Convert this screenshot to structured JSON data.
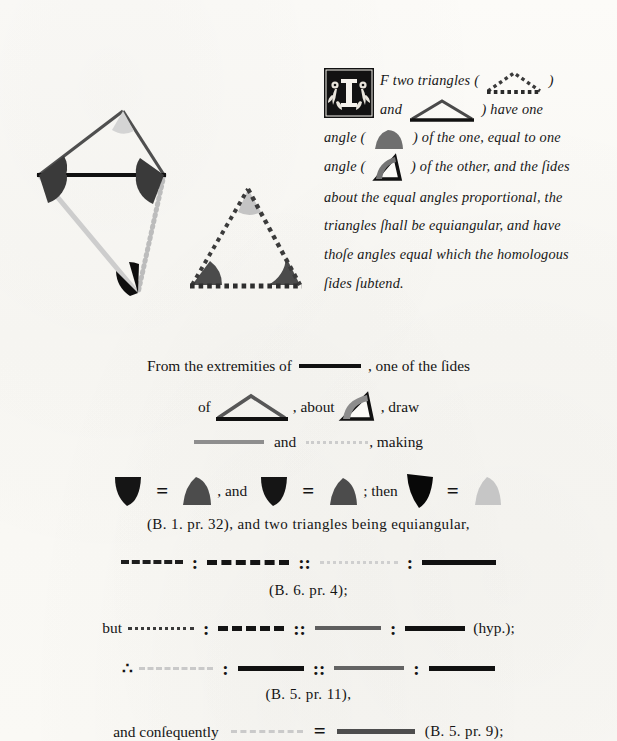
{
  "page": {
    "work": "Byrne's Euclid — Book VI, Proposition VI",
    "background_color": "#fbfaf7",
    "ink_color": "#141414"
  },
  "palette": {
    "black": "#111111",
    "dark_gray": "#4a4a4a",
    "mid_gray": "#7d7d7d",
    "light_gray": "#bdbdbd",
    "pale_gray": "#d6d6d6"
  },
  "enunciation": {
    "dropcap_letter": "I",
    "dropcap_name": "ornate-floral-initial-I",
    "line1_a": "F two triangles (",
    "line1_b": ") ",
    "line2_a": "and",
    "line2_b": ") have one",
    "line3_a": "angle (",
    "line3_b": ") of the one, equal to one",
    "line4_a": "angle (",
    "line4_b": ") of the other, and the ſides",
    "line5": "about the equal angles proportional, the",
    "line6": "triangles ſhall be equiangular, and have",
    "line7": "thoſe angles equal which the homologous",
    "line8": "ſides ſubtend."
  },
  "proof": {
    "l1_a": "From the extremities of",
    "l1_b": ", one of the ſides",
    "l2_a": "of",
    "l2_b": ", about",
    "l2_c": ", draw",
    "l3_a": "and",
    "l3_b": ", making",
    "l4_eq1": "=",
    "l4_and": ", and",
    "l4_eq2": "=",
    "l4_then": "; then",
    "l4_eq3": "=",
    "l5_ref": "(B. 1. pr. 32), and two triangles being equiangular,",
    "l6_ratio": ":",
    "l6_prop": "::",
    "l7_ref": "(B. 6. pr. 4);",
    "l8_but": "but",
    "l8_hyp": "(hyp.);",
    "l9_therefore": "∴",
    "l10_ref": "(B. 5. pr. 11),",
    "l11_a": "and conſequently",
    "l11_eq": "=",
    "l11_ref": "(B. 5. pr. 9);"
  },
  "figures": {
    "main": {
      "name": "two-equiangular-triangles-superposed",
      "upper_triangle": {
        "stroke": "#4a4a4a",
        "base_stroke": "#111111",
        "apex_angle_fill": "#d6d6d6",
        "left_base_angle_fill": "#3b3b3b",
        "right_base_angle_fill": "#3b3b3b"
      },
      "lower_triangle": {
        "left_side_stroke": "#c9c9c9",
        "right_side_stroke": "#b4b4b4",
        "right_side_style": "dotted",
        "vertex_angle_fill": "#0d0d0d"
      }
    },
    "second": {
      "name": "dotted-comparison-triangle",
      "stroke": "#3b3b3b",
      "style": "dotted",
      "apex_angle_fill": "#c2c2c2",
      "left_angle_fill": "#4a4a4a",
      "right_angle_fill": "#4a4a4a"
    }
  },
  "segments": {
    "black_thick": {
      "color": "#111111",
      "style": "solid",
      "thickness": 4
    },
    "black_thin": {
      "color": "#111111",
      "style": "solid",
      "thickness": 3
    },
    "dark_dash": {
      "color": "#2b2b2b",
      "style": "dashed"
    },
    "mid_dash": {
      "color": "#3b3b3b",
      "style": "dashed"
    },
    "mid_solid": {
      "color": "#8a8a8a",
      "style": "solid",
      "thickness": 3
    },
    "pale_dot": {
      "color": "#cfcfcf",
      "style": "dotted"
    },
    "dark_dot": {
      "color": "#2b2b2b",
      "style": "dotted"
    }
  }
}
